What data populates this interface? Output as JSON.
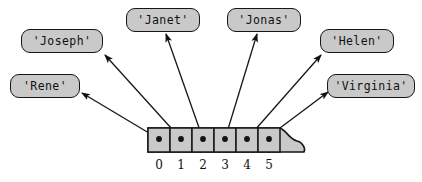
{
  "diagram": {
    "colors": {
      "cell_fill": "#c9c9c9",
      "node_fill": "#c9c9c9",
      "stroke": "#161616",
      "background": "#ffffff"
    },
    "array": {
      "name": "string-array",
      "x": 148,
      "y": 128,
      "cell_width": 22,
      "cell_height": 24,
      "cell_count": 6,
      "torn_edge": true,
      "indices": [
        "0",
        "1",
        "2",
        "3",
        "4",
        "5"
      ],
      "cells": [
        {
          "index": "0",
          "dot": true
        },
        {
          "index": "1",
          "dot": true
        },
        {
          "index": "2",
          "dot": true
        },
        {
          "index": "3",
          "dot": true
        },
        {
          "index": "4",
          "dot": true
        },
        {
          "index": "5",
          "dot": true
        }
      ]
    },
    "nodes": [
      {
        "id": "joseph",
        "label": "'Joseph'",
        "x": 21,
        "y": 29,
        "w": 82,
        "h": 24,
        "from_index": "1"
      },
      {
        "id": "rene",
        "label": "'Rene'",
        "x": 10,
        "y": 74,
        "w": 70,
        "h": 24,
        "from_index": "0"
      },
      {
        "id": "janet",
        "label": "'Janet'",
        "x": 126,
        "y": 8,
        "w": 74,
        "h": 24,
        "from_index": "2"
      },
      {
        "id": "jonas",
        "label": "'Jonas'",
        "x": 227,
        "y": 8,
        "w": 74,
        "h": 24,
        "from_index": "3"
      },
      {
        "id": "helen",
        "label": "'Helen'",
        "x": 320,
        "y": 29,
        "w": 74,
        "h": 24,
        "from_index": "4"
      },
      {
        "id": "virginia",
        "label": "'Virginia'",
        "x": 327,
        "y": 74,
        "w": 88,
        "h": 24,
        "from_index": "5"
      }
    ],
    "arrows": [
      {
        "name": "arrow-to-rene",
        "from": [
          159,
          139
        ],
        "to": [
          82,
          93
        ]
      },
      {
        "name": "arrow-to-joseph",
        "from": [
          181,
          139
        ],
        "to": [
          105,
          55
        ]
      },
      {
        "name": "arrow-to-janet",
        "from": [
          203,
          139
        ],
        "to": [
          166,
          34
        ]
      },
      {
        "name": "arrow-to-jonas",
        "from": [
          225,
          139
        ],
        "to": [
          257,
          34
        ]
      },
      {
        "name": "arrow-to-helen",
        "from": [
          247,
          139
        ],
        "to": [
          321,
          55
        ]
      },
      {
        "name": "arrow-to-virginia",
        "from": [
          264,
          140
        ],
        "to": [
          328,
          92
        ]
      }
    ]
  }
}
